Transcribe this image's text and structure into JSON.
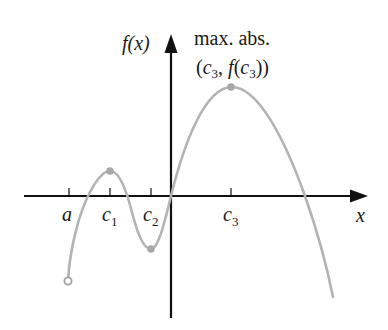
{
  "diagram": {
    "type": "function-graph",
    "y_axis_label": "f(x)",
    "x_axis_label": "x",
    "annotation": {
      "line1": "max. abs.",
      "line2_open": "(",
      "line2_c": "c",
      "line2_c_sub": "3",
      "line2_comma": ", ",
      "line2_f": "f",
      "line2_paren_open": "(",
      "line2_c2": "c",
      "line2_c2_sub": "3",
      "line2_close": "))"
    },
    "tick_labels": [
      {
        "main": "a",
        "sub": ""
      },
      {
        "main": "c",
        "sub": "1"
      },
      {
        "main": "c",
        "sub": "2"
      },
      {
        "main": "c",
        "sub": "3"
      }
    ],
    "points": {
      "left_endpoint": {
        "label": "a",
        "style": "open-circle"
      },
      "local_max": {
        "label": "c1",
        "style": "filled-dot"
      },
      "local_min": {
        "label": "c2",
        "style": "filled-dot"
      },
      "absolute_max": {
        "label": "c3",
        "style": "filled-dot"
      }
    },
    "colors": {
      "curve": "#b3b3b3",
      "axes": "#111111",
      "text": "#1a1a1a",
      "points": "#a8a8a8"
    }
  }
}
